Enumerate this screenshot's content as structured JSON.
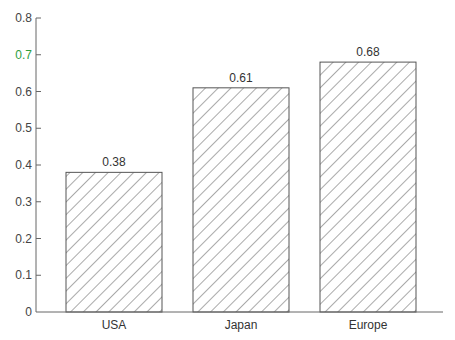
{
  "chart_data": {
    "type": "bar",
    "title": "",
    "xlabel": "",
    "ylabel": "",
    "categories": [
      "USA",
      "Japan",
      "Europe"
    ],
    "values": [
      0.38,
      0.61,
      0.68
    ],
    "value_labels": [
      "0.38",
      "0.61",
      "0.68"
    ],
    "ylim": [
      0,
      0.8
    ],
    "yticks": [
      0,
      0.1,
      0.2,
      0.3,
      0.4,
      0.5,
      0.6,
      0.7,
      0.8
    ],
    "ytick_labels": [
      "0",
      "0.1",
      "0.2",
      "0.3",
      "0.4",
      "0.5",
      "0.6",
      "0.7",
      "0.8"
    ],
    "grid": false,
    "legend": null,
    "bar_fill": "diagonal-hatch",
    "colors": {
      "bar_edge": "#555555",
      "hatch": "#555555",
      "axis": "#666666",
      "highlight_tick": "#2e9e3e"
    },
    "highlighted_tick_label": "0.7"
  }
}
